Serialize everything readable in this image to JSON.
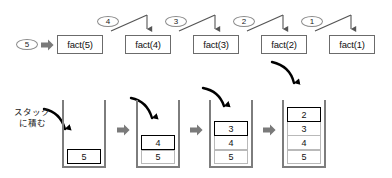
{
  "diagram": {
    "colors": {
      "background": "#ffffff",
      "box_border": "#6b6b6b",
      "oval_border": "#8a8a8a",
      "stack_wall": "#7d7d7d",
      "cell_border": "#b9b9b9",
      "top_cell_border": "#000000",
      "block_arrow": "#7a7a7a",
      "curve_arrow": "#000000",
      "line": "#555555",
      "text": "#111111"
    }
  },
  "call_trace": {
    "input_oval": {
      "label": "5",
      "name": "input-value-oval"
    },
    "input_arrow": {
      "name": "input-block-arrow"
    },
    "boxes": [
      {
        "label": "fact(5)"
      },
      {
        "label": "fact(4)"
      },
      {
        "label": "fact(3)"
      },
      {
        "label": "fact(2)"
      },
      {
        "label": "fact(1)"
      }
    ],
    "return_ovals": [
      {
        "label": "4"
      },
      {
        "label": "3"
      },
      {
        "label": "2"
      },
      {
        "label": "1"
      }
    ]
  },
  "stack_section": {
    "caption_line1": "スタック",
    "caption_line2": "に積む",
    "stacks": [
      {
        "cells": [
          "5"
        ],
        "top_index": 0
      },
      {
        "cells": [
          "5",
          "4"
        ],
        "top_index": 1
      },
      {
        "cells": [
          "5",
          "4",
          "3"
        ],
        "top_index": 2
      },
      {
        "cells": [
          "5",
          "4",
          "3",
          "2"
        ],
        "top_index": 3
      }
    ],
    "transition_arrows": [
      {
        "name": "stack-transition-arrow-1"
      },
      {
        "name": "stack-transition-arrow-2"
      },
      {
        "name": "stack-transition-arrow-3"
      }
    ],
    "push_arrows": [
      {
        "name": "push-curve-arrow-5"
      },
      {
        "name": "push-curve-arrow-4"
      },
      {
        "name": "push-curve-arrow-3"
      },
      {
        "name": "push-curve-arrow-2"
      }
    ]
  }
}
